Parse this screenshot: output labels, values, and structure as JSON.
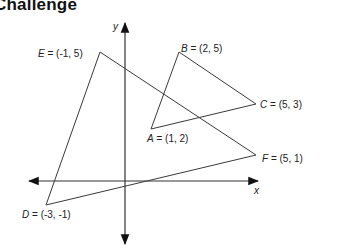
{
  "title": "Challenge",
  "axes": {
    "x_label": "x",
    "y_label": "y"
  },
  "points": {
    "A": {
      "name": "A",
      "coords": "(1, 2)",
      "x": 1,
      "y": 2
    },
    "B": {
      "name": "B",
      "coords": "(2, 5)",
      "x": 2,
      "y": 5
    },
    "C": {
      "name": "C",
      "coords": "(5, 3)",
      "x": 5,
      "y": 3
    },
    "D": {
      "name": "D",
      "coords": "(-3, -1)",
      "x": -3,
      "y": -1
    },
    "E": {
      "name": "E",
      "coords": "(-1, 5)",
      "x": -1,
      "y": 5
    },
    "F": {
      "name": "F",
      "coords": "(5, 1)",
      "x": 5,
      "y": 1
    }
  },
  "triangles": [
    {
      "name": "ABC",
      "vertices": [
        "A",
        "B",
        "C"
      ]
    },
    {
      "name": "DEF",
      "vertices": [
        "D",
        "E",
        "F"
      ]
    }
  ],
  "labels": {
    "A": " = (1, 2)",
    "B": " = (2, 5)",
    "C": " = (5, 3)",
    "D": " = (-3, -1)",
    "E": " = (-1, 5)",
    "F": " = (5, 1)"
  },
  "colors": {
    "line": "#3a3a3a",
    "text": "#222222"
  }
}
